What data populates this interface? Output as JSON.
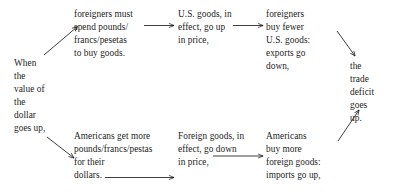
{
  "diagram": {
    "type": "flowchart",
    "text_color": "#1c1c1c",
    "background_color": "#ffffff",
    "nodes": {
      "when_dollar_rises": "When\nthe\nvalue of\nthe\ndollar\ngoes up,",
      "foreigners_spend": "foreigners must\nspend pounds/\nfrancs/pesetas\nto buy goods.",
      "us_goods_up": "U.S. goods, in\neffect, go up\nin price,",
      "foreigners_buy_fewer": "foreigners\nbuy fewer\nU.S. goods:\nexports go\ndown,",
      "americans_get_more": "Americans get more\npounds/francs/pestas\nfor their\ndollars.",
      "foreign_goods_down": "Foreign goods, in\neffect, go down\nin price,",
      "americans_buy_more": "Americans\nbuy more\nforeign goods:\nimports go up,",
      "trade_deficit_up": "the\ntrade\ndeficit\ngoes\nup."
    },
    "arrows": [
      {
        "name": "arrow-when-to-foreigners-spend",
        "from": "when_dollar_rises",
        "to": "foreigners_spend",
        "direction": "up-right"
      },
      {
        "name": "arrow-foreigners-spend-to-us-goods-up",
        "from": "foreigners_spend",
        "to": "us_goods_up",
        "direction": "right"
      },
      {
        "name": "arrow-us-goods-up-to-foreigners-buy-fewer",
        "from": "us_goods_up",
        "to": "foreigners_buy_fewer",
        "direction": "right"
      },
      {
        "name": "arrow-foreigners-buy-fewer-to-trade-deficit",
        "from": "foreigners_buy_fewer",
        "to": "trade_deficit_up",
        "direction": "down-right"
      },
      {
        "name": "arrow-when-to-americans-get-more",
        "from": "when_dollar_rises",
        "to": "americans_get_more",
        "direction": "down-right"
      },
      {
        "name": "arrow-americans-get-more-to-foreign-goods-down",
        "from": "americans_get_more",
        "to": "foreign_goods_down",
        "direction": "right"
      },
      {
        "name": "arrow-foreign-goods-down-to-americans-buy-more",
        "from": "foreign_goods_down",
        "to": "americans_buy_more",
        "direction": "right"
      },
      {
        "name": "arrow-americans-buy-more-to-trade-deficit",
        "from": "americans_buy_more",
        "to": "trade_deficit_up",
        "direction": "up-right"
      }
    ]
  }
}
